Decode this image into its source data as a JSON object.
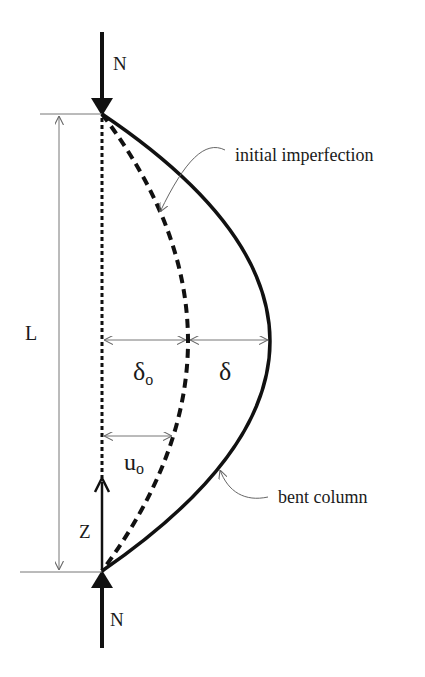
{
  "diagram": {
    "colors": {
      "ink": "#111111",
      "thin_line": "#777777",
      "text": "#1a1a1a",
      "background": "#ffffff"
    },
    "labels": {
      "load_top": "N",
      "load_bottom": "N",
      "length": "L",
      "axis": "Z",
      "initial_deflection": "δ",
      "initial_deflection_sub": "o",
      "additional_deflection": "δ",
      "imperfection_at_z": "u",
      "imperfection_at_z_sub": "o",
      "initial_imperfection": "initial imperfection",
      "bent_column": "bent column"
    }
  }
}
